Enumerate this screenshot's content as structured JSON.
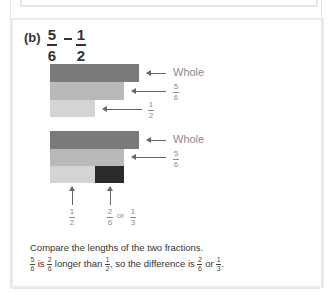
{
  "part_label": "(b)",
  "expression": {
    "left": {
      "num": "5",
      "den": "6"
    },
    "operator": "−",
    "right": {
      "num": "1",
      "den": "2"
    }
  },
  "diagram1": {
    "bars": [
      {
        "name": "whole",
        "fraction": "1",
        "color": "#7a7a7a"
      },
      {
        "name": "five-sixths",
        "fraction": "5/6",
        "color": "#b9b9b9"
      },
      {
        "name": "one-half",
        "fraction": "1/2",
        "color": "#d4d4d4"
      }
    ],
    "labels": {
      "whole": "Whole",
      "five_sixths": {
        "num": "5",
        "den": "6"
      },
      "one_half": {
        "num": "1",
        "den": "2"
      }
    }
  },
  "diagram2": {
    "labels": {
      "whole": "Whole",
      "five_sixths": {
        "num": "5",
        "den": "6"
      },
      "bottom_left": {
        "num": "1",
        "den": "2"
      },
      "bottom_right_a": {
        "num": "2",
        "den": "6"
      },
      "or": "or",
      "bottom_right_b": {
        "num": "1",
        "den": "3"
      }
    },
    "difference_color": "#2b2b2b"
  },
  "caption": {
    "line1": "Compare the lengths of the two fractions.",
    "line2": {
      "f1": {
        "num": "5",
        "den": "6"
      },
      "t1": "is",
      "f2": {
        "num": "2",
        "den": "6"
      },
      "t2": "longer than",
      "f3": {
        "num": "1",
        "den": "2"
      },
      "t3": ", so the difference is",
      "f4": {
        "num": "2",
        "den": "6"
      },
      "t4": "or",
      "f5": {
        "num": "1",
        "den": "3"
      },
      "t5": "."
    }
  }
}
